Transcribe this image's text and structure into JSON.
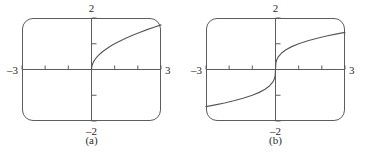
{
  "figure": {
    "background_color": "#ffffff",
    "ink_color": "#5c5c66",
    "curve_color": "#57575f",
    "text_color": "#2b2b2b"
  },
  "panels": [
    {
      "caption": "(a)",
      "labels": {
        "top": "2",
        "bottom": "–2",
        "left": "–3",
        "right": "3"
      }
    },
    {
      "caption": "(b)",
      "labels": {
        "top": "2",
        "bottom": "–2",
        "left": "–3",
        "right": "3"
      }
    }
  ],
  "chart_data": [
    {
      "type": "line",
      "title": "(a)",
      "xlabel": "",
      "ylabel": "",
      "xlim": [
        -3,
        3
      ],
      "ylim": [
        -2,
        2
      ],
      "grid": false,
      "legend": "none",
      "xticks": [
        -3,
        -2,
        -1,
        0,
        1,
        2,
        3
      ],
      "yticks": [
        -2,
        -1,
        0,
        1,
        2
      ],
      "xtick_labels": [
        "–3",
        "",
        "",
        "",
        "",
        "",
        "3"
      ],
      "ytick_labels": [
        "–2",
        "",
        "",
        "",
        "2"
      ],
      "annotations": [
        "–3",
        "3",
        "2",
        "–2"
      ],
      "series": [
        {
          "name": "sqrt(x)",
          "x": [
            0,
            0.02,
            0.05,
            0.1,
            0.15,
            0.2,
            0.3,
            0.4,
            0.5,
            0.7,
            0.9,
            1.1,
            1.3,
            1.5,
            1.8,
            2.1,
            2.4,
            2.7,
            3.0
          ],
          "y": [
            0,
            0.141,
            0.224,
            0.316,
            0.387,
            0.447,
            0.548,
            0.632,
            0.707,
            0.837,
            0.949,
            1.049,
            1.14,
            1.225,
            1.342,
            1.449,
            1.549,
            1.643,
            1.732
          ]
        }
      ]
    },
    {
      "type": "line",
      "title": "(b)",
      "xlabel": "",
      "ylabel": "",
      "xlim": [
        -3,
        3
      ],
      "ylim": [
        -2,
        2
      ],
      "grid": false,
      "legend": "none",
      "xticks": [
        -3,
        -2,
        -1,
        0,
        1,
        2,
        3
      ],
      "yticks": [
        -2,
        -1,
        0,
        1,
        2
      ],
      "xtick_labels": [
        "–3",
        "",
        "",
        "",
        "",
        "",
        "3"
      ],
      "ytick_labels": [
        "–2",
        "",
        "",
        "",
        "2"
      ],
      "annotations": [
        "–3",
        "3",
        "2",
        "–2"
      ],
      "series": [
        {
          "name": "cbrt(x)",
          "x": [
            -3.0,
            -2.6,
            -2.2,
            -1.8,
            -1.4,
            -1.0,
            -0.7,
            -0.45,
            -0.25,
            -0.12,
            -0.05,
            -0.015,
            0,
            0.015,
            0.05,
            0.12,
            0.25,
            0.45,
            0.7,
            1.0,
            1.4,
            1.8,
            2.2,
            2.6,
            3.0
          ],
          "y": [
            -1.442,
            -1.375,
            -1.301,
            -1.216,
            -1.119,
            -1.0,
            -0.888,
            -0.766,
            -0.63,
            -0.493,
            -0.368,
            -0.247,
            0,
            0.247,
            0.368,
            0.493,
            0.63,
            0.766,
            0.888,
            1.0,
            1.119,
            1.216,
            1.301,
            1.375,
            1.442
          ]
        }
      ]
    }
  ]
}
